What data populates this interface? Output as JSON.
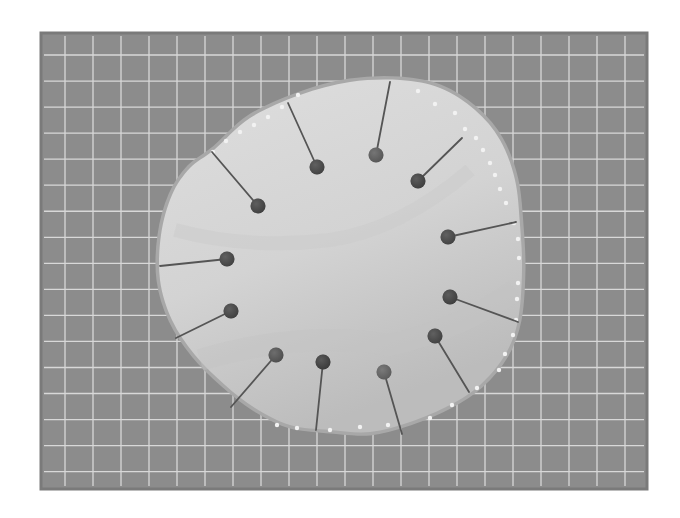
{
  "image": {
    "width": 680,
    "height": 518,
    "background": "#ffffff",
    "description": "Grayscale photo of a round pale membrane pinned to a gridded board with 13 pins"
  },
  "board": {
    "x": 41,
    "y": 33,
    "width": 606,
    "height": 456,
    "fill": "#8c8c8c",
    "border": "#7a7a7a",
    "grid_color": "#d8d8d8",
    "grid_spacing": 28,
    "grid_offset_x": 24,
    "grid_offset_y": 22
  },
  "specimen": {
    "fill_light": "#d9d9d9",
    "fill_mid": "#cbcbcb",
    "fill_shadow": "#bdbdbd",
    "rim_color": "#a8a8a8",
    "outline_points": [
      [
        214,
        150
      ],
      [
        250,
        118
      ],
      [
        300,
        95
      ],
      [
        350,
        82
      ],
      [
        400,
        80
      ],
      [
        440,
        88
      ],
      [
        475,
        110
      ],
      [
        500,
        140
      ],
      [
        515,
        180
      ],
      [
        520,
        225
      ],
      [
        522,
        270
      ],
      [
        518,
        320
      ],
      [
        505,
        355
      ],
      [
        480,
        385
      ],
      [
        450,
        405
      ],
      [
        410,
        422
      ],
      [
        370,
        432
      ],
      [
        330,
        430
      ],
      [
        290,
        425
      ],
      [
        255,
        408
      ],
      [
        225,
        385
      ],
      [
        195,
        355
      ],
      [
        172,
        320
      ],
      [
        160,
        280
      ],
      [
        161,
        235
      ],
      [
        172,
        195
      ],
      [
        190,
        168
      ]
    ],
    "edge_dots_color": "#f2f2f2",
    "edge_dots": [
      [
        213,
        152
      ],
      [
        226,
        141
      ],
      [
        240,
        132
      ],
      [
        254,
        125
      ],
      [
        268,
        117
      ],
      [
        282,
        107
      ],
      [
        298,
        95
      ],
      [
        418,
        91
      ],
      [
        435,
        104
      ],
      [
        455,
        113
      ],
      [
        465,
        129
      ],
      [
        476,
        138
      ],
      [
        483,
        150
      ],
      [
        490,
        163
      ],
      [
        495,
        175
      ],
      [
        500,
        189
      ],
      [
        506,
        203
      ],
      [
        514,
        223
      ],
      [
        518,
        239
      ],
      [
        519,
        258
      ],
      [
        518,
        283
      ],
      [
        517,
        299
      ],
      [
        516,
        320
      ],
      [
        513,
        335
      ],
      [
        505,
        354
      ],
      [
        499,
        370
      ],
      [
        477,
        388
      ],
      [
        452,
        405
      ],
      [
        430,
        418
      ],
      [
        388,
        425
      ],
      [
        360,
        427
      ],
      [
        330,
        430
      ],
      [
        297,
        428
      ],
      [
        277,
        425
      ]
    ]
  },
  "pins": {
    "head_radius": 7.5,
    "needle_color": "#555555",
    "needle_width": 1.8,
    "items": [
      {
        "head": [
          258,
          206
        ],
        "tip": [
          212,
          152
        ],
        "shade": "#474747"
      },
      {
        "head": [
          317,
          167
        ],
        "tip": [
          288,
          103
        ],
        "shade": "#4a4a4a"
      },
      {
        "head": [
          376,
          155
        ],
        "tip": [
          390,
          82
        ],
        "shade": "#6a6a6a"
      },
      {
        "head": [
          418,
          181
        ],
        "tip": [
          462,
          138
        ],
        "shade": "#454545"
      },
      {
        "head": [
          448,
          237
        ],
        "tip": [
          516,
          222
        ],
        "shade": "#4b4b4b"
      },
      {
        "head": [
          450,
          297
        ],
        "tip": [
          518,
          322
        ],
        "shade": "#444444"
      },
      {
        "head": [
          435,
          336
        ],
        "tip": [
          469,
          392
        ],
        "shade": "#4a4a4a"
      },
      {
        "head": [
          384,
          372
        ],
        "tip": [
          402,
          434
        ],
        "shade": "#727272"
      },
      {
        "head": [
          323,
          362
        ],
        "tip": [
          316,
          430
        ],
        "shade": "#3f3f3f"
      },
      {
        "head": [
          276,
          355
        ],
        "tip": [
          231,
          407
        ],
        "shade": "#5e5e5e"
      },
      {
        "head": [
          231,
          311
        ],
        "tip": [
          176,
          338
        ],
        "shade": "#484848"
      },
      {
        "head": [
          227,
          259
        ],
        "tip": [
          160,
          266
        ],
        "shade": "#4a4a4a"
      }
    ]
  }
}
